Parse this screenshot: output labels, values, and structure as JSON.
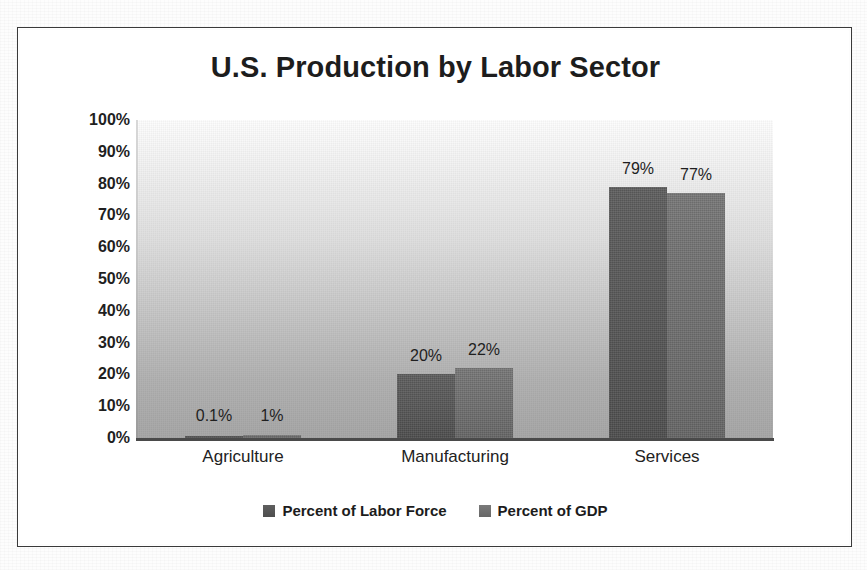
{
  "chart_data": {
    "type": "bar",
    "title": "U.S. Production by Labor Sector",
    "xlabel": "",
    "ylabel": "",
    "categories": [
      "Agriculture",
      "Manufacturing",
      "Services"
    ],
    "series": [
      {
        "name": "Percent of Labor Force",
        "color": "#565656",
        "values": [
          0.1,
          20,
          79
        ],
        "value_labels": [
          "0.1%",
          "20%",
          "22%"
        ]
      },
      {
        "name": "Percent of GDP",
        "color": "#6e6e6e",
        "values": [
          1,
          22,
          77
        ],
        "value_labels": [
          "1%",
          "22%",
          "77%"
        ]
      }
    ],
    "data_labels": [
      {
        "category": "Agriculture",
        "series": "Percent of Labor Force",
        "text": "0.1%",
        "value": 0.1
      },
      {
        "category": "Agriculture",
        "series": "Percent of GDP",
        "text": "1%",
        "value": 1
      },
      {
        "category": "Manufacturing",
        "series": "Percent of Labor Force",
        "text": "20%",
        "value": 20
      },
      {
        "category": "Manufacturing",
        "series": "Percent of GDP",
        "text": "22%",
        "value": 22
      },
      {
        "category": "Services",
        "series": "Percent of Labor Force",
        "text": "79%",
        "value": 79
      },
      {
        "category": "Services",
        "series": "Percent of GDP",
        "text": "77%",
        "value": 77
      }
    ],
    "ylim": [
      0,
      100
    ],
    "ytick_step": 10,
    "ytick_labels": [
      "100%",
      "90%",
      "80%",
      "70%",
      "60%",
      "50%",
      "40%",
      "30%",
      "20%",
      "10%",
      "0%"
    ],
    "ytick_values": [
      100,
      90,
      80,
      70,
      60,
      50,
      40,
      30,
      20,
      10,
      0
    ],
    "grid": false,
    "legend_position": "bottom",
    "value_suffix": "%",
    "plot_background": "white-to-gray vertical gradient",
    "frame_color": "#3a3a3a"
  },
  "axis": {
    "y_ticks": [
      {
        "label": "100%",
        "value": 100
      },
      {
        "label": "90%",
        "value": 90
      },
      {
        "label": "80%",
        "value": 80
      },
      {
        "label": "70%",
        "value": 70
      },
      {
        "label": "60%",
        "value": 60
      },
      {
        "label": "50%",
        "value": 50
      },
      {
        "label": "40%",
        "value": 40
      },
      {
        "label": "30%",
        "value": 30
      },
      {
        "label": "20%",
        "value": 20
      },
      {
        "label": "10%",
        "value": 10
      },
      {
        "label": "0%",
        "value": 0
      }
    ],
    "categories": [
      {
        "label": "Agriculture"
      },
      {
        "label": "Manufacturing"
      },
      {
        "label": "Services"
      }
    ]
  },
  "legend": {
    "entries": [
      {
        "label": "Percent of Labor Force",
        "color": "#565656"
      },
      {
        "label": "Percent of GDP",
        "color": "#6e6e6e"
      }
    ]
  }
}
